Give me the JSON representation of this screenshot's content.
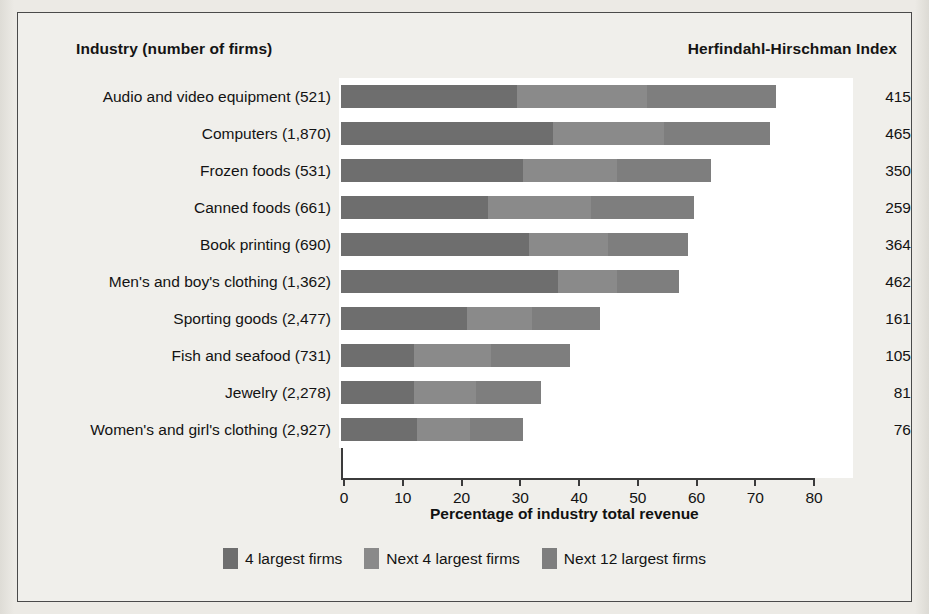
{
  "headings": {
    "industry": "Industry (number of firms)",
    "hhi": "Herfindahl-Hirschman Index"
  },
  "axis": {
    "xlabel": "Percentage of industry total revenue",
    "ticks": [
      "0",
      "10",
      "20",
      "30",
      "40",
      "50",
      "60",
      "70",
      "80"
    ]
  },
  "legend": {
    "items": [
      {
        "label": "4 largest firms",
        "color": "#6e6e6e"
      },
      {
        "label": "Next 4 largest firms",
        "color": "#8a8a8a"
      },
      {
        "label": "Next 12 largest firms",
        "color": "#7e7e7e"
      }
    ]
  },
  "chart_data": {
    "type": "bar",
    "title": "",
    "subtitle": "",
    "orientation": "horizontal",
    "stacked": true,
    "xlabel": "Percentage of industry total revenue",
    "ylabel": "Industry (number of firms)",
    "xlim": [
      0,
      80
    ],
    "grid": false,
    "legend_position": "bottom",
    "categories": [
      "Audio and video equipment  (521)",
      "Computers  (1,870)",
      "Frozen foods  (531)",
      "Canned foods  (661)",
      "Book printing  (690)",
      "Men's and boy's clothing  (1,362)",
      "Sporting goods  (2,477)",
      "Fish and seafood  (731)",
      "Jewelry  (2,278)",
      "Women's and girl's clothing  (2,927)"
    ],
    "series": [
      {
        "name": "4 largest firms",
        "color": "#6e6e6e",
        "values": [
          30,
          36,
          31,
          25,
          32,
          37,
          21.5,
          12.5,
          12.5,
          13
        ]
      },
      {
        "name": "Next 4 largest firms",
        "color": "#8a8a8a",
        "values": [
          22,
          19,
          16,
          17.5,
          13.5,
          10,
          11,
          13,
          10.5,
          9
        ]
      },
      {
        "name": "Next 12 largest firms",
        "color": "#7e7e7e",
        "values": [
          22,
          18,
          16,
          17.5,
          13.5,
          10.5,
          11.5,
          13.5,
          11,
          9
        ]
      }
    ],
    "totals": [
      74,
      73,
      63,
      60,
      59,
      57.5,
      44,
      39,
      34,
      31
    ],
    "annotations": {
      "hhi_label": "Herfindahl-Hirschman Index",
      "hhi_values": [
        415,
        465,
        350,
        259,
        364,
        462,
        161,
        105,
        81,
        76
      ]
    }
  },
  "rows": [
    {
      "category": "Audio and video equipment  (521)",
      "hhi": "415",
      "segments": [
        30,
        22,
        22
      ]
    },
    {
      "category": "Computers  (1,870)",
      "hhi": "465",
      "segments": [
        36,
        19,
        18
      ]
    },
    {
      "category": "Frozen foods  (531)",
      "hhi": "350",
      "segments": [
        31,
        16,
        16
      ]
    },
    {
      "category": "Canned foods  (661)",
      "hhi": "259",
      "segments": [
        25,
        17.5,
        17.5
      ]
    },
    {
      "category": "Book printing  (690)",
      "hhi": "364",
      "segments": [
        32,
        13.5,
        13.5
      ]
    },
    {
      "category": "Men's and boy's clothing  (1,362)",
      "hhi": "462",
      "segments": [
        37,
        10,
        10.5
      ]
    },
    {
      "category": "Sporting goods  (2,477)",
      "hhi": "161",
      "segments": [
        21.5,
        11,
        11.5
      ]
    },
    {
      "category": "Fish and seafood  (731)",
      "hhi": "105",
      "segments": [
        12.5,
        13,
        13.5
      ]
    },
    {
      "category": "Jewelry  (2,278)",
      "hhi": "81",
      "segments": [
        12.5,
        10.5,
        11
      ]
    },
    {
      "category": "Women's and girl's clothing  (2,927)",
      "hhi": "76",
      "segments": [
        13,
        9,
        9
      ]
    }
  ],
  "scale": {
    "px_per_unit": 5.875,
    "max": 80
  }
}
